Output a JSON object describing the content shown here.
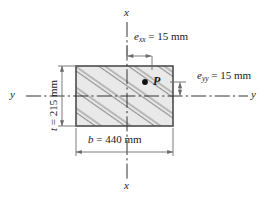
{
  "figure": {
    "type": "engineering-cross-section",
    "colors": {
      "outline": "#4d4d4d",
      "fill": "#e8e8e8",
      "hatch": "#8c8c8c",
      "dimension": "#6b6b6b",
      "centerline": "#333333",
      "text": "#1a1a1a"
    },
    "axes": {
      "x_top": "x",
      "x_bottom": "x",
      "y_left": "y",
      "y_right": "y"
    },
    "labels": {
      "e_xx": {
        "symbol": "e",
        "subscript": "xx",
        "equals": "=",
        "value": "15",
        "unit": "mm"
      },
      "e_yy": {
        "symbol": "e",
        "subscript": "yy",
        "equals": "=",
        "value": "15",
        "unit": "mm"
      },
      "width": {
        "symbol": "b",
        "equals": "=",
        "value": "440",
        "unit": "mm"
      },
      "thickness": {
        "symbol": "t",
        "equals": "=",
        "value": "215",
        "unit": "mm"
      },
      "point": "P"
    }
  }
}
